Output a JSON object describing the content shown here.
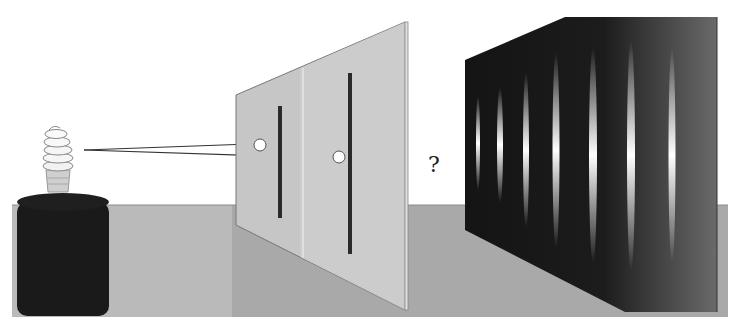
{
  "diagram": {
    "question_mark": "?",
    "elements": {
      "light_source": {
        "label": "light bulb on dark base",
        "icon": "lightbulb-icon"
      },
      "barrier": {
        "label": "barrier with two slits",
        "slits": 2,
        "holes": 2
      },
      "screen": {
        "label": "detection screen with interference pattern",
        "fringes": 7
      }
    },
    "colors": {
      "background": "#ffffff",
      "floor": "#a8a8a8",
      "floor_light": "#bdbdbd",
      "base": "#1a1a1a",
      "barrier": "#c4c4c4",
      "barrier_edge": "#d8d8d8",
      "slit": "#2a2a2a",
      "screen_dark": "#141414",
      "screen_light": "#6e6e6e",
      "fringe": "#f0f0f0",
      "arrow": "#333333"
    }
  }
}
